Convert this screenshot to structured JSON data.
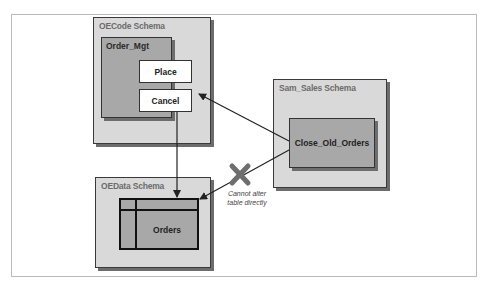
{
  "diagram": {
    "schemas": [
      {
        "id": "oecode",
        "label": "OECode Schema"
      },
      {
        "id": "oedata",
        "label": "OEData Schema"
      },
      {
        "id": "sam_sales",
        "label": "Sam_Sales Schema"
      }
    ],
    "packages": [
      {
        "id": "order_mgt",
        "label": "Order_Mgt",
        "schema": "oecode",
        "procedures": [
          "Place",
          "Cancel"
        ]
      }
    ],
    "procedures": {
      "place": "Place",
      "cancel": "Cancel",
      "close_old_orders": "Close_Old_Orders"
    },
    "tables": [
      {
        "id": "orders",
        "label": "Orders",
        "schema": "oedata"
      }
    ],
    "edges": [
      {
        "from": "Close_Old_Orders",
        "to": "Cancel",
        "allowed": true
      },
      {
        "from": "Cancel",
        "to": "Orders",
        "allowed": true
      },
      {
        "from": "Close_Old_Orders",
        "to": "Orders",
        "allowed": false,
        "note": "Cannot alter table directly"
      }
    ],
    "note_lines": [
      "Cannot alter",
      "table directly"
    ],
    "colors": {
      "schema_fill": "#d9d9d9",
      "package_fill": "#a8a8a8",
      "procedure_fill": "#ffffff",
      "blocked_mark": "#6e6e6e",
      "arrow": "#222222"
    }
  }
}
